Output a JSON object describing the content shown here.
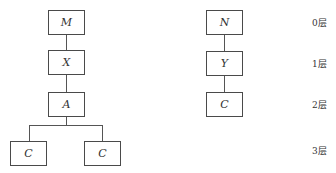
{
  "left_tree": {
    "nodes": [
      {
        "id": "M",
        "label": "M",
        "layer": 0
      },
      {
        "id": "X",
        "label": "X",
        "layer": 1
      },
      {
        "id": "A",
        "label": "A",
        "layer": 2
      },
      {
        "id": "C1",
        "label": "C",
        "layer": 3
      },
      {
        "id": "C2",
        "label": "C",
        "layer": 3
      }
    ],
    "edges": [
      [
        "M",
        "X"
      ],
      [
        "X",
        "A"
      ],
      [
        "A",
        "C1"
      ],
      [
        "A",
        "C2"
      ]
    ]
  },
  "right_tree": {
    "nodes": [
      {
        "id": "N",
        "label": "N",
        "layer": 0
      },
      {
        "id": "Y",
        "label": "Y",
        "layer": 1
      },
      {
        "id": "C",
        "label": "C",
        "layer": 2
      }
    ],
    "edges": [
      [
        "N",
        "Y"
      ],
      [
        "Y",
        "C"
      ]
    ]
  },
  "layers": [
    "0层",
    "1层",
    "2层",
    "3层"
  ]
}
